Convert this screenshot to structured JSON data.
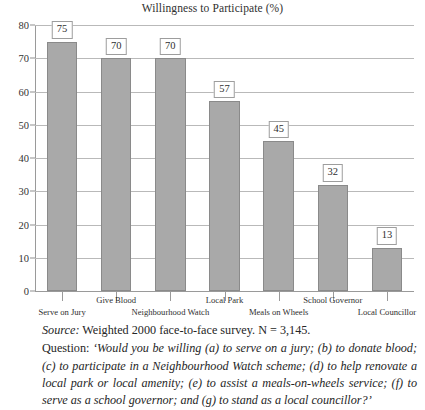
{
  "chart_data": {
    "type": "bar",
    "title": "Willingness to Participate (%)",
    "xlabel": "",
    "ylabel": "",
    "ylim": [
      0,
      80
    ],
    "ytick_step": 10,
    "yticks": [
      "0",
      "10",
      "20",
      "30",
      "40",
      "50",
      "60",
      "70",
      "80"
    ],
    "grid": true,
    "legend": "none",
    "categories": [
      "Serve on Jury",
      "Give Blood",
      "Neighbourhood Watch",
      "Local Park",
      "Meals on Wheels",
      "School Governor",
      "Local Councillor"
    ],
    "values": [
      75,
      70,
      70,
      57,
      45,
      32,
      13
    ],
    "value_labels": [
      "75",
      "70",
      "70",
      "57",
      "45",
      "32",
      "13"
    ],
    "bar_color": "#a9a9a9",
    "bar_border_color": "#8a8a8a",
    "gridline_color": "#b9b9b9",
    "axis_color": "#9a9a9a"
  },
  "caption": {
    "source_label": "Source:",
    "source_text": "Weighted 2000 face-to-face survey. N = 3,145.",
    "question_label": "Question:",
    "question_text": "‘Would you be willing (a) to serve on a jury; (b) to donate blood; (c) to participate in a Neighbourhood Watch scheme; (d) to help renovate a local park or local amenity; (e) to assist a meals-on-wheels service; (f) to serve as a school governor; and (g) to stand as a local councillor?’"
  }
}
